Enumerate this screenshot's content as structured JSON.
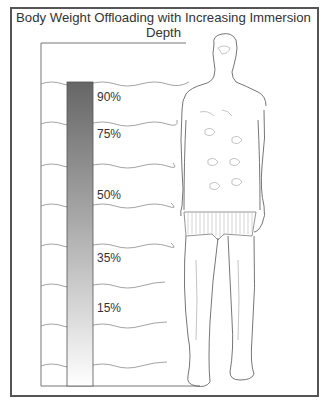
{
  "figure": {
    "title": "Body Weight Offloading with Increasing Immersion Depth",
    "bar": {
      "gradient_top_color": "#6b6b6b",
      "gradient_bottom_color": "#ffffff",
      "labels": [
        {
          "text": "90%",
          "y": 90
        },
        {
          "text": "75%",
          "y": 127
        },
        {
          "text": "50%",
          "y": 188
        },
        {
          "text": "35%",
          "y": 251
        },
        {
          "text": "15%",
          "y": 301
        }
      ]
    },
    "illustration": "standing human figure outline partially immersed in water with wavy depth lines"
  }
}
